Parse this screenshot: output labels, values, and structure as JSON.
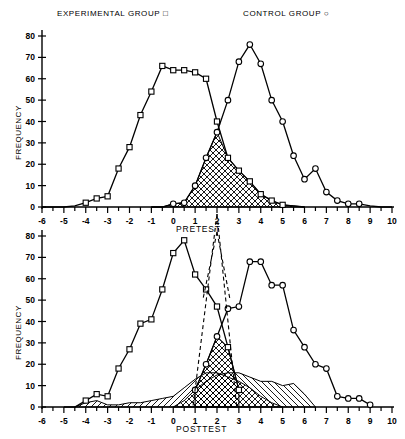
{
  "legend": {
    "experimental": "EXPERIMENTAL GROUP",
    "experimental_marker": "square-marker-icon",
    "control": "CONTROL GROUP",
    "control_marker": "circle-marker-icon"
  },
  "axis_titles": {
    "pretest": "PRETEST",
    "posttest": "POSTTEST",
    "y": "FREQUENCY"
  },
  "colors": {
    "line": "#000000",
    "background": "#ffffff",
    "hatch": "#000000"
  },
  "chart_data": [
    {
      "type": "line",
      "title": "PRETEST",
      "panel": "top",
      "xlabel": "PRETEST",
      "ylabel": "FREQUENCY",
      "xlim": [
        -6,
        10
      ],
      "ylim": [
        0,
        80
      ],
      "xticks": [
        -6,
        -5,
        -4,
        -3,
        -2,
        -1,
        0,
        1,
        2,
        3,
        4,
        5,
        6,
        7,
        8,
        9,
        10
      ],
      "xtick_labels": [
        "-6",
        "-5",
        "-4",
        "-3",
        "-2",
        "-1",
        "0",
        "1",
        "2",
        "3",
        "4",
        "5",
        "6",
        "7",
        "8",
        "9",
        "10"
      ],
      "minor_tick_step": 0.5,
      "yticks": [
        0,
        10,
        20,
        30,
        40,
        50,
        60,
        70,
        80
      ],
      "ytick_labels": [
        "0",
        "10",
        "20",
        "30",
        "40",
        "50",
        "60",
        "70",
        "80"
      ],
      "grid": false,
      "legend_position": "above-plot",
      "annotations": [
        "cross-hatched overlap region between the two distributions, approx x = 0.5 to x = 4"
      ],
      "series": [
        {
          "name": "EXPERIMENTAL GROUP",
          "marker": "square",
          "x": [
            -6,
            -5.5,
            -5,
            -4.5,
            -4,
            -3.5,
            -3,
            -2.5,
            -2,
            -1.5,
            -1,
            -0.5,
            0,
            0.5,
            1,
            1.5,
            2,
            2.5,
            3,
            3.5,
            4,
            4.5,
            5,
            5.5,
            6
          ],
          "values": [
            0,
            0,
            0,
            0.5,
            2,
            4,
            5,
            18,
            28,
            43,
            54,
            66,
            64,
            64,
            63,
            60,
            40,
            23,
            17,
            12,
            6,
            3,
            1,
            0.5,
            0
          ]
        },
        {
          "name": "CONTROL GROUP",
          "marker": "circle",
          "x": [
            -1,
            -0.5,
            0,
            0.5,
            1,
            1.5,
            2,
            2.5,
            3,
            3.5,
            4,
            4.5,
            5,
            5.5,
            6,
            6.5,
            7,
            7.5,
            8,
            8.5,
            9,
            9.5,
            10
          ],
          "values": [
            0,
            0,
            1.5,
            2,
            10,
            23,
            35,
            50,
            68,
            76,
            67,
            50,
            40,
            24,
            13,
            18,
            7,
            3,
            1.5,
            1.5,
            0.5,
            0,
            0
          ]
        }
      ]
    },
    {
      "type": "line",
      "title": "POSTTEST",
      "panel": "bottom",
      "xlabel": "POSTTEST",
      "ylabel": "FREQUENCY",
      "xlim": [
        -6,
        10
      ],
      "ylim": [
        0,
        80
      ],
      "xticks": [
        -6,
        -5,
        -4,
        -3,
        -2,
        -1,
        0,
        1,
        2,
        3,
        4,
        5,
        6,
        7,
        8,
        9,
        10
      ],
      "xtick_labels": [
        "-6",
        "-5",
        "-4",
        "-3",
        "-2",
        "-1",
        "0",
        "1",
        "2",
        "3",
        "4",
        "5",
        "6",
        "7",
        "8",
        "9",
        "10"
      ],
      "minor_tick_step": 0.5,
      "yticks": [
        0,
        10,
        20,
        30,
        40,
        50,
        60,
        70,
        80
      ],
      "ytick_labels": [
        "0",
        "10",
        "20",
        "30",
        "40",
        "50",
        "60",
        "70",
        "80"
      ],
      "grid": false,
      "legend_position": "shared-with-top-panel",
      "annotations": [
        "diagonal-hatched low distributions along the baseline",
        "cross-hatched overlap near x = 1 to x = 3",
        "dashed projection lines descend from the PRETEST axis above"
      ],
      "series": [
        {
          "name": "EXPERIMENTAL GROUP",
          "marker": "square",
          "x": [
            -5,
            -4.5,
            -4,
            -3.5,
            -3,
            -2.5,
            -2,
            -1.5,
            -1,
            -0.5,
            0,
            0.5,
            1,
            1.5,
            2,
            2.5,
            3
          ],
          "values": [
            0,
            0,
            3,
            6,
            5,
            18,
            27,
            39,
            41,
            55,
            72,
            78,
            62,
            55,
            47,
            28,
            8
          ]
        },
        {
          "name": "CONTROL GROUP",
          "marker": "circle",
          "x": [
            1,
            1.5,
            2,
            2.5,
            3,
            3.5,
            4,
            4.5,
            5,
            5.5,
            6,
            6.5,
            7,
            7.5,
            8,
            8.5,
            9
          ],
          "values": [
            8,
            20,
            33,
            46,
            47,
            68,
            68,
            57,
            57,
            36,
            28,
            20,
            18,
            5,
            4,
            4,
            1
          ]
        }
      ],
      "hatched_areas": [
        {
          "name": "experimental-posttest-shifted",
          "pattern": "diagonal",
          "x": [
            -4.5,
            -4,
            -3.5,
            -3,
            -2.5,
            -2,
            -1.5,
            -1,
            -0.5,
            0,
            0.5,
            1,
            1.5,
            2,
            2.5,
            3,
            3.5,
            4,
            4.5,
            5
          ],
          "values": [
            0,
            2,
            3,
            1,
            1,
            2,
            2,
            3,
            4,
            5,
            9,
            13,
            16,
            16,
            14,
            12,
            9,
            5,
            2,
            0
          ]
        },
        {
          "name": "control-posttest-shifted",
          "pattern": "diagonal-reverse",
          "x": [
            0,
            0.5,
            1,
            1.5,
            2,
            2.5,
            3,
            3.5,
            4,
            4.5,
            5,
            5.5,
            6,
            6.5
          ],
          "values": [
            0,
            3,
            8,
            12,
            15,
            16,
            16,
            14,
            12,
            12,
            10,
            11,
            6,
            0
          ]
        }
      ]
    }
  ]
}
